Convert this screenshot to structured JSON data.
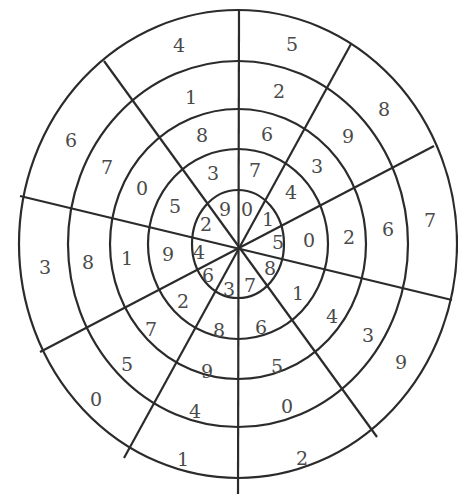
{
  "diagram": {
    "type": "number-wheel",
    "center": [
      238,
      244
    ],
    "ring_radii": [
      {
        "rx": 46,
        "ry": 54
      },
      {
        "rx": 90,
        "ry": 95
      },
      {
        "rx": 128,
        "ry": 135
      },
      {
        "rx": 170,
        "ry": 183
      },
      {
        "rx": 219,
        "ry": 234
      }
    ],
    "spokes": [
      {
        "x1": 239,
        "y1": 10,
        "x2": 238,
        "y2": 494
      },
      {
        "x1": 104,
        "y1": 61,
        "x2": 377,
        "y2": 437
      },
      {
        "x1": 20,
        "y1": 196,
        "x2": 452,
        "y2": 300
      },
      {
        "x1": 351,
        "y1": 44,
        "x2": 124,
        "y2": 458
      },
      {
        "x1": 434,
        "y1": 146,
        "x2": 40,
        "y2": 352
      }
    ],
    "cells": [
      {
        "ring": 0,
        "label": "9",
        "x": 225,
        "y": 209
      },
      {
        "ring": 0,
        "label": "0",
        "x": 247,
        "y": 209
      },
      {
        "ring": 0,
        "label": "1",
        "x": 268,
        "y": 219
      },
      {
        "ring": 0,
        "label": "5",
        "x": 278,
        "y": 242
      },
      {
        "ring": 0,
        "label": "8",
        "x": 270,
        "y": 268
      },
      {
        "ring": 0,
        "label": "7",
        "x": 250,
        "y": 285
      },
      {
        "ring": 0,
        "label": "3",
        "x": 229,
        "y": 289
      },
      {
        "ring": 0,
        "label": "6",
        "x": 208,
        "y": 275
      },
      {
        "ring": 0,
        "label": "4",
        "x": 199,
        "y": 252
      },
      {
        "ring": 0,
        "label": "2",
        "x": 206,
        "y": 224
      },
      {
        "ring": 1,
        "label": "7",
        "x": 255,
        "y": 170
      },
      {
        "ring": 1,
        "label": "4",
        "x": 291,
        "y": 192
      },
      {
        "ring": 1,
        "label": "0",
        "x": 309,
        "y": 240
      },
      {
        "ring": 1,
        "label": "1",
        "x": 298,
        "y": 293
      },
      {
        "ring": 1,
        "label": "6",
        "x": 261,
        "y": 327
      },
      {
        "ring": 1,
        "label": "8",
        "x": 219,
        "y": 330
      },
      {
        "ring": 1,
        "label": "2",
        "x": 183,
        "y": 301
      },
      {
        "ring": 1,
        "label": "9",
        "x": 168,
        "y": 254
      },
      {
        "ring": 1,
        "label": "5",
        "x": 175,
        "y": 206
      },
      {
        "ring": 1,
        "label": "3",
        "x": 213,
        "y": 173
      },
      {
        "ring": 2,
        "label": "6",
        "x": 267,
        "y": 134
      },
      {
        "ring": 2,
        "label": "3",
        "x": 317,
        "y": 166
      },
      {
        "ring": 2,
        "label": "2",
        "x": 349,
        "y": 237
      },
      {
        "ring": 2,
        "label": "4",
        "x": 332,
        "y": 316
      },
      {
        "ring": 2,
        "label": "5",
        "x": 277,
        "y": 366
      },
      {
        "ring": 2,
        "label": "9",
        "x": 207,
        "y": 371
      },
      {
        "ring": 2,
        "label": "7",
        "x": 151,
        "y": 329
      },
      {
        "ring": 2,
        "label": "1",
        "x": 127,
        "y": 258
      },
      {
        "ring": 2,
        "label": "0",
        "x": 142,
        "y": 188
      },
      {
        "ring": 2,
        "label": "8",
        "x": 202,
        "y": 135
      },
      {
        "ring": 3,
        "label": "2",
        "x": 279,
        "y": 91
      },
      {
        "ring": 3,
        "label": "9",
        "x": 348,
        "y": 136
      },
      {
        "ring": 3,
        "label": "6",
        "x": 388,
        "y": 229
      },
      {
        "ring": 3,
        "label": "3",
        "x": 368,
        "y": 335
      },
      {
        "ring": 3,
        "label": "0",
        "x": 287,
        "y": 406
      },
      {
        "ring": 3,
        "label": "4",
        "x": 195,
        "y": 411
      },
      {
        "ring": 3,
        "label": "5",
        "x": 127,
        "y": 364
      },
      {
        "ring": 3,
        "label": "8",
        "x": 88,
        "y": 262
      },
      {
        "ring": 3,
        "label": "7",
        "x": 107,
        "y": 167
      },
      {
        "ring": 3,
        "label": "1",
        "x": 191,
        "y": 97
      },
      {
        "ring": 4,
        "label": "5",
        "x": 292,
        "y": 44
      },
      {
        "ring": 4,
        "label": "8",
        "x": 384,
        "y": 109
      },
      {
        "ring": 4,
        "label": "7",
        "x": 430,
        "y": 220
      },
      {
        "ring": 4,
        "label": "9",
        "x": 401,
        "y": 362
      },
      {
        "ring": 4,
        "label": "2",
        "x": 302,
        "y": 458
      },
      {
        "ring": 4,
        "label": "1",
        "x": 183,
        "y": 459
      },
      {
        "ring": 4,
        "label": "0",
        "x": 96,
        "y": 399
      },
      {
        "ring": 4,
        "label": "3",
        "x": 45,
        "y": 267
      },
      {
        "ring": 4,
        "label": "6",
        "x": 71,
        "y": 140
      },
      {
        "ring": 4,
        "label": "4",
        "x": 179,
        "y": 45
      }
    ]
  }
}
